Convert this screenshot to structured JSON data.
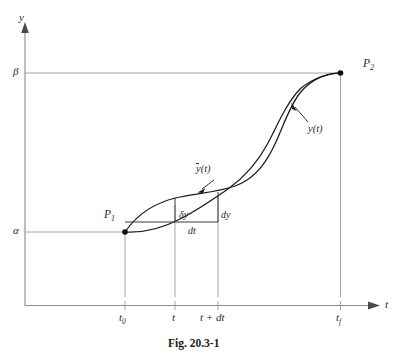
{
  "figure": {
    "caption": "Fig. 20.3-1",
    "axes": {
      "y_axis_label": "y",
      "x_axis_label": "t"
    },
    "y_levels": [
      {
        "name": "beta",
        "label": "β",
        "meaning": "upper-level-y-value"
      },
      {
        "name": "alpha",
        "label": "α",
        "meaning": "lower-level-y-value"
      }
    ],
    "x_ticks": [
      {
        "name": "t0",
        "label": "t",
        "sub": "0"
      },
      {
        "name": "t",
        "label": "t",
        "sub": ""
      },
      {
        "name": "t-plus-dt",
        "label": "t + dt",
        "sub": ""
      },
      {
        "name": "tf",
        "label": "t",
        "sub": "f"
      }
    ],
    "points": [
      {
        "name": "P1",
        "label": "P",
        "sub": "1"
      },
      {
        "name": "P2",
        "label": "P",
        "sub": "2"
      }
    ],
    "curve_labels": [
      {
        "name": "y-bar-of-t",
        "label": "(t)",
        "prefix": "y",
        "overbar": true
      },
      {
        "name": "y-of-t",
        "label": "y(t)",
        "prefix": "",
        "overbar": false
      }
    ],
    "increment_labels": [
      {
        "name": "delta-y",
        "label": "δy"
      },
      {
        "name": "dy",
        "label": "dy"
      },
      {
        "name": "dt",
        "label": "dt"
      }
    ],
    "colors": {
      "curve": "#1a1a1a",
      "axis": "#8b8b8b",
      "grid": "#9a9a9a",
      "background": "#ffffff",
      "text": "#2b2b2b"
    }
  }
}
